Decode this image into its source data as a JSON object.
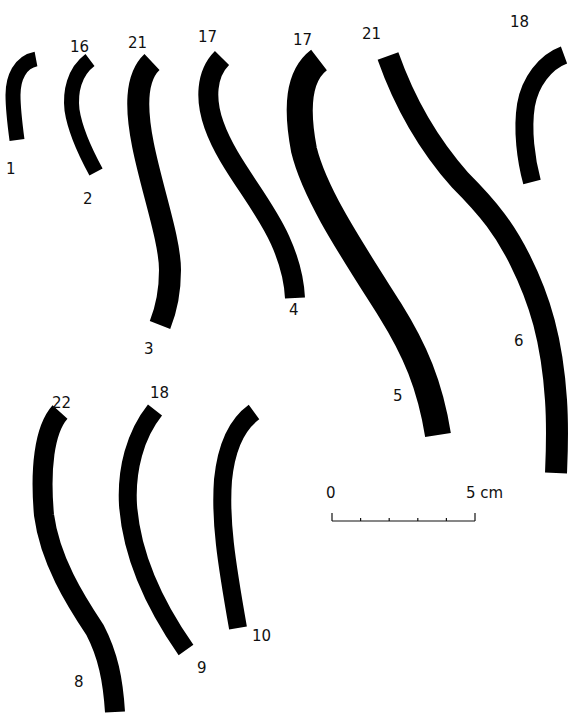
{
  "figure": {
    "type": "archaeological-profile-drawing",
    "ink_color": "#000000",
    "background_color": "#ffffff",
    "truncated_caption": "",
    "objects": [
      {
        "id": "1",
        "label": "1",
        "top_value": ""
      },
      {
        "id": "2",
        "label": "2",
        "top_value": "16"
      },
      {
        "id": "3",
        "label": "3",
        "top_value": "21"
      },
      {
        "id": "4",
        "label": "4",
        "top_value": "17"
      },
      {
        "id": "5",
        "label": "5",
        "top_value": "17"
      },
      {
        "id": "6",
        "label": "6",
        "top_value": "21"
      },
      {
        "id": "7",
        "label": "",
        "top_value": "18"
      },
      {
        "id": "8",
        "label": "8",
        "top_value": "22"
      },
      {
        "id": "9",
        "label": "9",
        "top_value": "18"
      },
      {
        "id": "10",
        "label": "10",
        "top_value": ""
      }
    ],
    "scale_bar": {
      "start_label": "0",
      "end_label": "5 cm",
      "divisions": 5
    }
  }
}
